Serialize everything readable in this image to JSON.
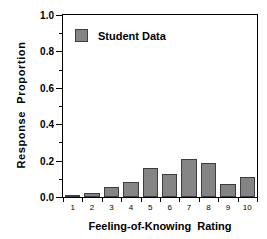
{
  "chart_data": {
    "type": "bar",
    "title": "",
    "xlabel": "Feeling-of-Knowing  Rating",
    "ylabel": "Response  Proportion",
    "categories": [
      "1",
      "2",
      "3",
      "4",
      "5",
      "6",
      "7",
      "8",
      "9",
      "10"
    ],
    "values": [
      0.008,
      0.022,
      0.055,
      0.085,
      0.16,
      0.125,
      0.21,
      0.185,
      0.07,
      0.11
    ],
    "series": [
      {
        "name": "Student Data",
        "values": [
          0.008,
          0.022,
          0.055,
          0.085,
          0.16,
          0.125,
          0.21,
          0.185,
          0.07,
          0.11
        ],
        "color": "#848484"
      }
    ],
    "ylim": [
      0.0,
      1.0
    ],
    "yticks": [
      "0.0",
      "0.2",
      "0.4",
      "0.6",
      "0.8",
      "1.0"
    ],
    "ytick_values": [
      0.0,
      0.2,
      0.4,
      0.6,
      0.8,
      1.0
    ],
    "yminor_values": [
      0.1,
      0.3,
      0.5,
      0.7,
      0.9
    ],
    "grid": false,
    "legend": {
      "position": "top-left-inside",
      "entries": [
        {
          "label": "Student Data",
          "color": "#848484"
        }
      ]
    },
    "bar_color": "#848484",
    "bar_edge_color": "#3d3d3d",
    "axis_color": "#000000",
    "background": "#ffffff"
  }
}
